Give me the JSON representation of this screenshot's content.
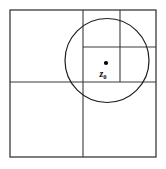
{
  "figure": {
    "type": "quadtree-subdivision-diagram",
    "title": "",
    "background_color": "#ffffff",
    "line_color": "#3a3a3a",
    "circle_color": "#1d1d1d",
    "dot_color": "#000000",
    "outer_square": {
      "x": 10,
      "y": 10,
      "width": 146,
      "height": 147
    },
    "subdivision_lines": [
      {
        "name": "root-vertical-split",
        "x1": 83,
        "y1": 10,
        "x2": 83,
        "y2": 157
      },
      {
        "name": "root-horizontal-split",
        "x1": 10,
        "y1": 82,
        "x2": 156,
        "y2": 82
      },
      {
        "name": "quadrant-vertical-split",
        "x1": 120,
        "y1": 10,
        "x2": 120,
        "y2": 82
      },
      {
        "name": "quadrant-horizontal-split",
        "x1": 83,
        "y1": 47,
        "x2": 156,
        "y2": 47
      }
    ],
    "circle": {
      "cx": 107,
      "cy": 60.5,
      "r": 42
    },
    "point": {
      "cx": 106,
      "cy": 63,
      "r": 2.1,
      "label": "z",
      "subscript": "0",
      "label_x": 103,
      "label_y": 77
    }
  }
}
